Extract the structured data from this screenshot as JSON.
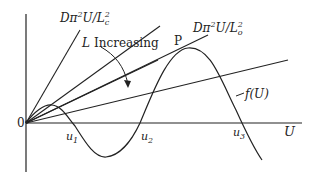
{
  "diagram": {
    "labels": {
      "line_critical_prefix": "Dπ",
      "line_critical_sup": "2",
      "line_critical_mid": "U/L",
      "line_critical_sub": "c",
      "line_critical_sup2": "2",
      "line_tangent_prefix": "Dπ",
      "line_tangent_sup": "2",
      "line_tangent_mid": "U/L",
      "line_tangent_sub": "o",
      "line_tangent_sup2": "2",
      "increasing_var": "L",
      "increasing_text": "Increasing",
      "point_P": "P",
      "curve": "f(U)",
      "origin": "0",
      "x_axis": "U",
      "root1": "u",
      "root1_sub": "1",
      "root2": "u",
      "root2_sub": "2",
      "root3": "u",
      "root3_sub": "3"
    }
  }
}
